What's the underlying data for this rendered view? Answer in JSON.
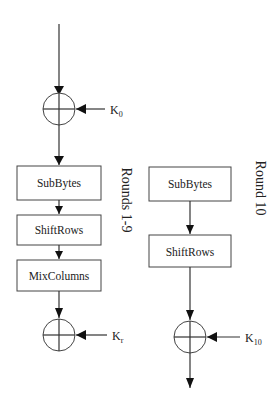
{
  "diagram": {
    "initial_key": {
      "label": "K",
      "subscript": "0"
    },
    "rounds_1_9": {
      "label": "Rounds 1-9",
      "steps": [
        "SubBytes",
        "ShiftRows",
        "MixColumns"
      ],
      "key": {
        "label": "K",
        "subscript": "r"
      }
    },
    "round_10": {
      "label": "Round 10",
      "steps": [
        "SubBytes",
        "ShiftRows"
      ],
      "key": {
        "label": "K",
        "subscript": "10"
      }
    },
    "colors": {
      "stroke": "#444444",
      "text": "#222222",
      "background": "#ffffff"
    }
  }
}
